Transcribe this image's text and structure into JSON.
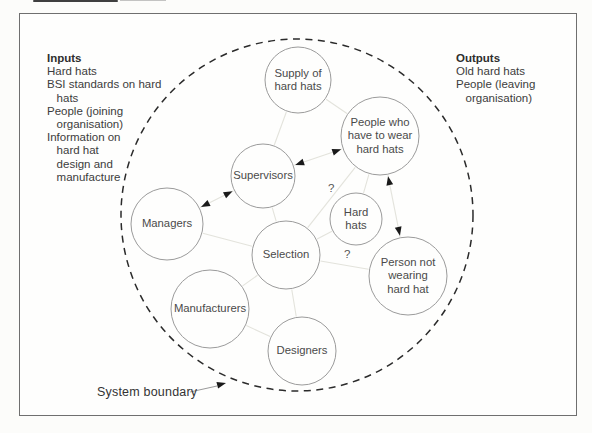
{
  "inputs_panel": {
    "title": "Inputs",
    "lines": [
      "Hard hats",
      "BSI standards on hard",
      "   hats",
      "People (joining",
      "   organisation)",
      "Information on",
      "   hard hat",
      "   design and",
      "   manufacture"
    ]
  },
  "outputs_panel": {
    "title": "Outputs",
    "lines": [
      "Old hard hats",
      "People (leaving",
      "   organisation)"
    ]
  },
  "boundary_label": "System boundary",
  "colors": {
    "page_bg": "#fcfcfa",
    "frame": "#6f6f6f",
    "circle_stroke": "#9b9b9b",
    "circle_fill": "#fefefd",
    "dashed_boundary": "#2b2b2b",
    "faint_edge": "#e3e3dc",
    "arrowhead": "#1a1a1a",
    "question_mark": "#555555",
    "pointer_line": "#9a9a9a"
  },
  "diagram": {
    "boundary": {
      "cx": 297,
      "cy": 215,
      "r": 176
    },
    "nodes": [
      {
        "id": "supply-of-hard-hats",
        "label": "Supply of\nhard hats",
        "cx": 298,
        "cy": 80,
        "r": 33
      },
      {
        "id": "people-who-wear",
        "label": "People who\nhave to wear\nhard hats",
        "cx": 380,
        "cy": 136,
        "r": 39
      },
      {
        "id": "supervisors",
        "label": "Supervisors",
        "cx": 263,
        "cy": 176,
        "r": 32
      },
      {
        "id": "managers",
        "label": "Managers",
        "cx": 167,
        "cy": 224,
        "r": 36
      },
      {
        "id": "hard-hats",
        "label": "Hard\nhats",
        "cx": 356,
        "cy": 219,
        "r": 26
      },
      {
        "id": "selection",
        "label": "Selection",
        "cx": 286,
        "cy": 255,
        "r": 34
      },
      {
        "id": "person-not-wearing",
        "label": "Person not\nwearing\nhard hat",
        "cx": 408,
        "cy": 276,
        "r": 39
      },
      {
        "id": "manufacturers",
        "label": "Manufacturers",
        "cx": 210,
        "cy": 309,
        "r": 39
      },
      {
        "id": "designers",
        "label": "Designers",
        "cx": 302,
        "cy": 351,
        "r": 34
      }
    ],
    "faint_edges": [
      [
        "supply-of-hard-hats",
        "supervisors"
      ],
      [
        "supply-of-hard-hats",
        "people-who-wear"
      ],
      [
        "supervisors",
        "selection"
      ],
      [
        "managers",
        "selection"
      ],
      [
        "selection",
        "manufacturers"
      ],
      [
        "selection",
        "designers"
      ],
      [
        "selection",
        "hard-hats"
      ],
      [
        "selection",
        "person-not-wearing"
      ],
      [
        "people-who-wear",
        "selection"
      ],
      [
        "hard-hats",
        "people-who-wear"
      ],
      [
        "manufacturers",
        "designers"
      ]
    ],
    "arrow_edges": [
      [
        "managers",
        "supervisors"
      ],
      [
        "supervisors",
        "people-who-wear"
      ],
      [
        "people-who-wear",
        "person-not-wearing"
      ]
    ],
    "question_marks": [
      {
        "text": "?",
        "x": 328,
        "y": 192
      },
      {
        "text": "?",
        "x": 344,
        "y": 258
      }
    ],
    "boundary_pointer": {
      "x1": 190,
      "y1": 392,
      "x2": 217,
      "y2": 386,
      "tipx": 226,
      "tipy": 383
    }
  }
}
